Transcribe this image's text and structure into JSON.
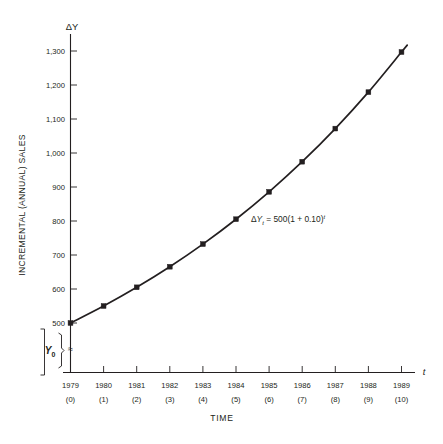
{
  "chart_data": {
    "type": "line",
    "title": "",
    "xlabel": "TIME",
    "ylabel": "INCREMENTAL (ANNUAL) SALES",
    "y_axis_symbol": "ΔY",
    "x_axis_symbol": "t",
    "categories": [
      "1979",
      "1980",
      "1981",
      "1982",
      "1983",
      "1984",
      "1985",
      "1986",
      "1987",
      "1988",
      "1989"
    ],
    "period_labels": [
      "(0)",
      "(1)",
      "(2)",
      "(3)",
      "(4)",
      "(5)",
      "(6)",
      "(7)",
      "(8)",
      "(9)",
      "(10)"
    ],
    "x": [
      0,
      1,
      2,
      3,
      4,
      5,
      6,
      7,
      8,
      9,
      10
    ],
    "values": [
      500,
      550,
      605,
      665.5,
      732.05,
      805.26,
      885.78,
      974.36,
      1071.79,
      1178.97,
      1296.87
    ],
    "ylim": [
      440,
      1340
    ],
    "ytick_values": [
      500,
      600,
      700,
      800,
      900,
      1000,
      1100,
      1200,
      1300
    ],
    "ytick_labels": [
      "500",
      "600",
      "700",
      "800",
      "900",
      "1,000",
      "1,100",
      "1,200",
      "1,300"
    ],
    "grid": false,
    "legend": null,
    "markers": "filled-square",
    "annotations": [
      {
        "name": "growth-equation",
        "text_plain": "ΔYt = 500(1 + 0.10)t",
        "delta": "Δ",
        "var": "Y",
        "subscript": "t",
        "body": " = 500(1 + 0.10)",
        "exponent": "t"
      }
    ],
    "axis_break": {
      "label": "Y",
      "subscript": "0",
      "symbol": "≈",
      "description": "Bracketed base value Y-sub-zero below the axis break"
    }
  },
  "figure": {
    "y_axis_title": "INCREMENTAL (ANNUAL) SALES",
    "x_axis_title": "TIME",
    "y_axis_symbol": "ΔY",
    "x_axis_symbol": "t",
    "ytick_labels": [
      "1,300",
      "1,200",
      "1,100",
      "1,000",
      "900",
      "800",
      "700",
      "600",
      "500"
    ],
    "xtick_labels": [
      "1979",
      "1980",
      "1981",
      "1982",
      "1983",
      "1984",
      "1985",
      "1986",
      "1987",
      "1988",
      "1989"
    ],
    "xtick_sublabels": [
      "(0)",
      "(1)",
      "(2)",
      "(3)",
      "(4)",
      "(5)",
      "(6)",
      "(7)",
      "(8)",
      "(9)",
      "(10)"
    ],
    "equation": {
      "delta": "Δ",
      "variable": "Y",
      "subscript": "t",
      "body": " = 500(1 + 0.10)",
      "exponent": "t"
    },
    "base_bracket": {
      "label": "Y",
      "subscript": "0",
      "break_symbol": "≈"
    },
    "colors": {
      "ink": "#231f20",
      "background": "#ffffff"
    }
  }
}
